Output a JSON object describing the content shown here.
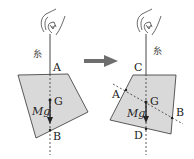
{
  "diagram": {
    "type": "physics-center-of-gravity",
    "left_panel": {
      "string_label": "糸",
      "points": {
        "top": "A",
        "bottom": "B",
        "center": "G"
      },
      "force_label": "Mg"
    },
    "transition_arrow": "right-arrow",
    "right_panel": {
      "string_label": "糸",
      "points": {
        "top": "C",
        "bottom": "D",
        "center": "G",
        "left": "A",
        "right": "B"
      },
      "force_label": "Mg"
    },
    "colors": {
      "plate_fill": "#d9d9d9",
      "line": "#333333",
      "arrow": "#6e6e6e"
    }
  }
}
